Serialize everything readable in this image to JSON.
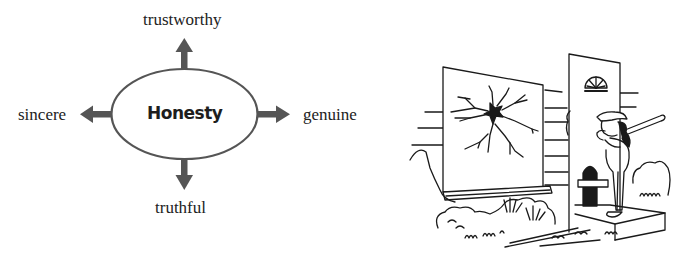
{
  "diagram": {
    "center": "Honesty",
    "branches": {
      "top": "trustworthy",
      "left": "sincere",
      "right": "genuine",
      "bottom": "truthful"
    },
    "colors": {
      "arrow": "#555555",
      "ellipse_stroke": "#555555",
      "text": "#222222"
    }
  },
  "illustration": {
    "description": "Cartoon of a girl in a baseball cap holding a bat, knocking on a front door next to a house window with a broken pane (shattered glass star crack), bushes and grass in the foreground",
    "elements": [
      "broken-window",
      "window-sill",
      "front-door",
      "girl-with-bat",
      "bushes",
      "grass",
      "doorstep"
    ]
  }
}
